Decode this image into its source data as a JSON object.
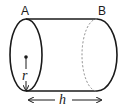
{
  "diagram": {
    "shape": "cylinder",
    "labels": {
      "top_left": "A",
      "top_right": "B",
      "radius": "r",
      "height": "h"
    },
    "colors": {
      "stroke": "#1a1a1a",
      "dashed": "#888888",
      "background": "#ffffff"
    }
  }
}
